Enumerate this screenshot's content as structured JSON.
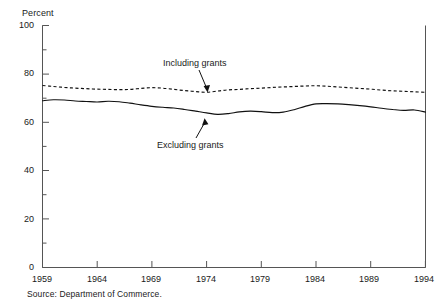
{
  "chart_data": {
    "type": "line",
    "title": "",
    "subtitle": "",
    "ylabel": "Percent",
    "xlabel": "",
    "ylim": [
      0,
      100
    ],
    "xlim": [
      1959,
      1994
    ],
    "grid": false,
    "legend_position": "inline-annotations",
    "y_ticks": [
      100,
      80,
      60,
      40,
      20,
      0
    ],
    "y_minor_ticks": [
      90,
      70,
      50,
      30,
      10
    ],
    "x_ticks": [
      1959,
      1964,
      1969,
      1974,
      1979,
      1984,
      1989,
      1994
    ],
    "x": [
      1959,
      1960,
      1961,
      1962,
      1963,
      1964,
      1965,
      1966,
      1967,
      1968,
      1969,
      1970,
      1971,
      1972,
      1973,
      1974,
      1975,
      1976,
      1977,
      1978,
      1979,
      1980,
      1981,
      1982,
      1983,
      1984,
      1985,
      1986,
      1987,
      1988,
      1989,
      1990,
      1991,
      1992,
      1993,
      1994
    ],
    "series": [
      {
        "name": "Including grants",
        "style": "dashed",
        "values": [
          75.2,
          74.8,
          74.4,
          74.1,
          73.9,
          73.7,
          73.6,
          73.5,
          73.6,
          74.0,
          74.3,
          74.1,
          73.6,
          73.1,
          72.7,
          72.4,
          72.9,
          73.4,
          73.6,
          73.9,
          74.1,
          74.4,
          74.6,
          74.8,
          75.0,
          75.1,
          74.9,
          74.6,
          74.3,
          74.0,
          73.7,
          73.3,
          73.0,
          72.8,
          72.6,
          72.4
        ]
      },
      {
        "name": "Excluding grants",
        "style": "solid",
        "values": [
          68.9,
          69.3,
          69.2,
          68.8,
          68.6,
          68.4,
          68.7,
          68.5,
          67.9,
          67.2,
          66.6,
          66.2,
          65.9,
          65.3,
          64.6,
          63.9,
          63.3,
          63.6,
          64.3,
          64.6,
          64.4,
          64.0,
          64.2,
          65.2,
          66.6,
          67.6,
          67.7,
          67.6,
          67.3,
          66.9,
          66.4,
          65.8,
          65.3,
          64.9,
          65.1,
          64.2
        ]
      }
    ],
    "annotations": [
      {
        "text": "Including grants",
        "target_series": "Including grants",
        "target_x": 1974
      },
      {
        "text": "Excluding grants",
        "target_series": "Excluding grants",
        "target_x": 1974
      }
    ],
    "source": "Source: Department of Commerce."
  },
  "labels": {
    "y_axis_title": "Percent",
    "y_ticks": [
      "100",
      "80",
      "60",
      "40",
      "20",
      "0"
    ],
    "x_ticks": [
      "1959",
      "1964",
      "1969",
      "1974",
      "1979",
      "1984",
      "1989",
      "1994"
    ],
    "annotation_including": "Including grants",
    "annotation_excluding": "Excluding grants",
    "source": "Source: Department of Commerce."
  }
}
